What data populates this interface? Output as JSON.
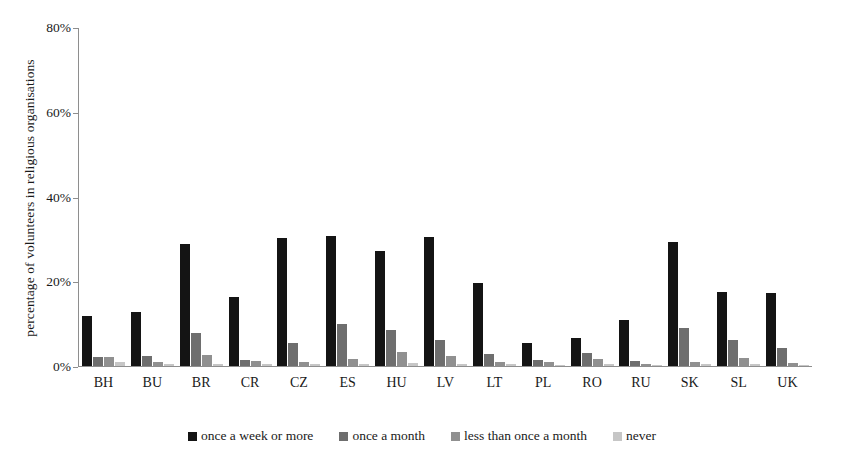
{
  "chart_data": {
    "type": "bar",
    "title": "",
    "xlabel": "",
    "ylabel": "percentage of volunteers in religious organisations",
    "ylim": [
      0,
      80
    ],
    "yticks": [
      "0%",
      "20%",
      "40%",
      "60%",
      "80%"
    ],
    "ytick_values": [
      0,
      20,
      40,
      60,
      80
    ],
    "grid": false,
    "legend_position": "bottom",
    "categories": [
      "BH",
      "BU",
      "BR",
      "CR",
      "CZ",
      "ES",
      "HU",
      "LV",
      "LT",
      "PL",
      "RO",
      "RU",
      "SK",
      "SL",
      "UK"
    ],
    "series": [
      {
        "name": "once a week or more",
        "color": "#141414",
        "values": [
          11.7,
          12.7,
          28.9,
          16.3,
          30.3,
          30.6,
          27.1,
          30.5,
          19.6,
          5.5,
          6.6,
          10.9,
          29.2,
          17.5,
          17.3
        ]
      },
      {
        "name": "once a month",
        "color": "#6e6e6e",
        "values": [
          2.1,
          2.4,
          7.9,
          1.4,
          5.5,
          9.9,
          8.4,
          6.1,
          2.8,
          1.4,
          3.1,
          1.3,
          8.9,
          6.1,
          4.3
        ]
      },
      {
        "name": "less than once a month",
        "color": "#909090",
        "values": [
          2.1,
          1.0,
          2.6,
          1.2,
          1.0,
          1.6,
          3.2,
          2.3,
          1.0,
          0.9,
          1.7,
          0.5,
          0.9,
          2.0,
          0.8
        ]
      },
      {
        "name": "never",
        "color": "#c6c6c6",
        "values": [
          0.9,
          0.4,
          0.5,
          0.4,
          0.4,
          0.5,
          0.6,
          0.5,
          0.4,
          0.3,
          0.5,
          0.3,
          0.4,
          0.4,
          0.3
        ]
      }
    ]
  }
}
